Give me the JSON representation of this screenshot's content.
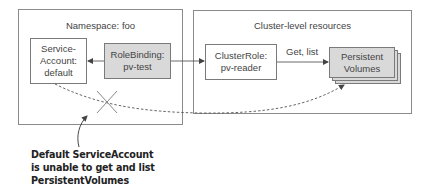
{
  "namespace": {
    "title": "Namespace: foo",
    "service_account": {
      "line1": "Service-",
      "line2": "Account:",
      "line3": "default"
    },
    "role_binding": {
      "line1": "RoleBinding:",
      "line2": "pv-test"
    }
  },
  "cluster": {
    "title": "Cluster-level resources",
    "cluster_role": {
      "line1": "ClusterRole:",
      "line2": "pv-reader"
    },
    "persistent_volumes": {
      "line1": "Persistent",
      "line2": "Volumes"
    }
  },
  "edges": {
    "get_list_label": "Get, list"
  },
  "annotation": {
    "line1": "Default ServiceAccount",
    "line2": "is unable to get and list",
    "line3": "PersistentVolumes"
  },
  "colors": {
    "border": "#7a7a7a",
    "shaded_fill": "#d9d9d9",
    "text": "#444444"
  }
}
